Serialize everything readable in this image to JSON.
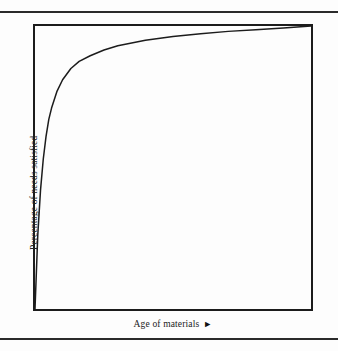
{
  "figure": {
    "cut_text_fragment": "·  ·                    ·              ·   ·",
    "y_axis_label": "Percentage of needs satisfied",
    "x_axis_label": "Age of materials",
    "x_axis_arrow": "►",
    "frame_color": "#1c1c1c",
    "curve_color": "#1c1c1c",
    "rule_color": "#2b2b2b",
    "background_color": "#fdfdfd"
  },
  "chart_data": {
    "type": "line",
    "title": "",
    "subtitle": "",
    "xlabel": "Age of materials",
    "ylabel": "Percentage of needs satisfied",
    "xlim": [
      0,
      100
    ],
    "ylim": [
      0,
      100
    ],
    "grid": false,
    "legend": null,
    "axis_ticks": {
      "x": [],
      "y": []
    },
    "annotations": [
      "Curve rises steeply from the origin and flattens asymptotically toward 100%, illustrating diminishing returns as materials age."
    ],
    "series": [
      {
        "name": "Percentage of needs satisfied",
        "x": [
          0,
          1,
          2,
          3,
          4,
          5,
          6,
          8,
          10,
          13,
          16,
          20,
          25,
          30,
          40,
          50,
          60,
          70,
          80,
          90,
          100
        ],
        "y": [
          0,
          26,
          42,
          53,
          61,
          67,
          71,
          77,
          81,
          85,
          87.5,
          89.5,
          91.5,
          93,
          95,
          96.3,
          97.3,
          98.1,
          98.7,
          99.3,
          100
        ]
      }
    ]
  }
}
